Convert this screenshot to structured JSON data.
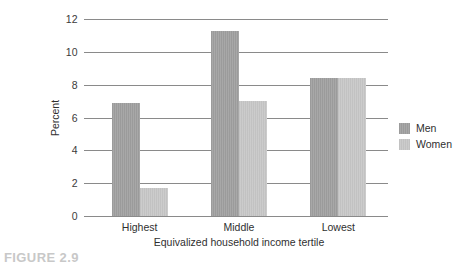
{
  "caption": "FIGURE 2.9",
  "legend": {
    "position": "right",
    "items": [
      {
        "label": "Men",
        "color": "#9b9b9b",
        "swatch_name": "legend-swatch-men"
      },
      {
        "label": "Women",
        "color": "#c2c2c2",
        "swatch_name": "legend-swatch-women"
      }
    ]
  },
  "chart_data": {
    "type": "bar",
    "title": "",
    "subtitle": "",
    "xlabel": "Equivalized household income tertile",
    "ylabel": "Percent",
    "categories": [
      "Highest",
      "Middle",
      "Lowest"
    ],
    "series": [
      {
        "name": "Men",
        "color": "#9b9b9b",
        "values": [
          6.9,
          11.3,
          8.4
        ]
      },
      {
        "name": "Women",
        "color": "#c2c2c2",
        "values": [
          1.7,
          7.0,
          8.4
        ]
      }
    ],
    "ylim": [
      0,
      12
    ],
    "ytick_labels": [
      "0",
      "2",
      "4",
      "6",
      "8",
      "10",
      "12"
    ],
    "ytick_values": [
      0,
      2,
      4,
      6,
      8,
      10,
      12
    ],
    "grid": "horizontal",
    "legend_position": "right",
    "annotations": []
  }
}
